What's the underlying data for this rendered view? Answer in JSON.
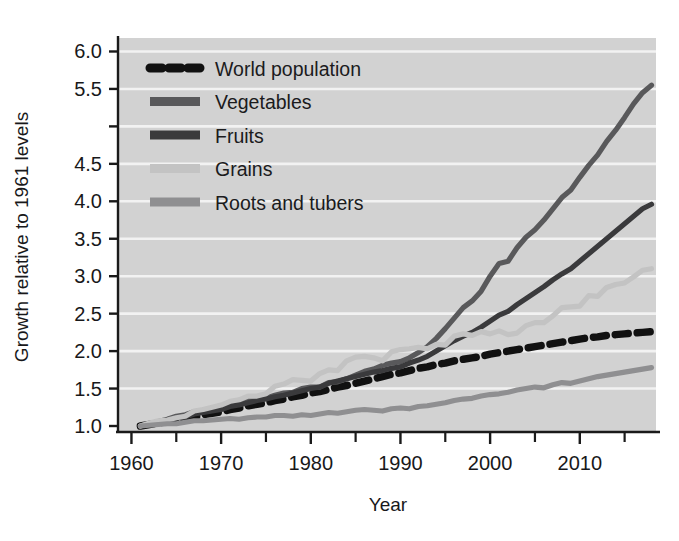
{
  "figure": {
    "background": "#ffffff",
    "plot_background": "#d2d2d2",
    "gridline_color": "#f2f2f2",
    "axis_color": "#1a1a1a"
  },
  "axes": {
    "x_title": "Year",
    "y_title": "Growth relative to 1961 levels",
    "x_ticks": [
      "1960",
      "1970",
      "1980",
      "1990",
      "2000",
      "2010"
    ],
    "x_tick_values": [
      1960,
      1970,
      1980,
      1990,
      2000,
      2010
    ],
    "x_minor_tick_values": [
      1965,
      1975,
      1985,
      1995,
      2005,
      2015
    ],
    "y_ticks": [
      "1.0",
      "1.5",
      "2.0",
      "2.5",
      "3.0",
      "3.5",
      "4.0",
      "4.5",
      "5.5",
      "6.0"
    ],
    "y_tick_values": [
      1.0,
      1.5,
      2.0,
      2.5,
      3.0,
      3.5,
      4.0,
      4.5,
      5.5,
      6.0
    ],
    "y_gridline_values": [
      1.5,
      2.0,
      2.5,
      3.0,
      3.5,
      4.0,
      4.5,
      5.0,
      5.5,
      6.0
    ],
    "xlim": [
      1958.5,
      2018.5
    ],
    "ylim": [
      0.92,
      6.18
    ]
  },
  "legend": {
    "position": "top-left-inside",
    "items": [
      {
        "label": "World population",
        "color": "#111111",
        "style": "dashed",
        "swatch": "dashed-thick"
      },
      {
        "label": "Vegetables",
        "color": "#59595b",
        "style": "solid",
        "swatch": "bar"
      },
      {
        "label": "Fruits",
        "color": "#3a3a3c",
        "style": "solid",
        "swatch": "bar"
      },
      {
        "label": "Grains",
        "color": "#c3c3c3",
        "style": "solid",
        "swatch": "bar"
      },
      {
        "label": "Roots and tubers",
        "color": "#8f8f91",
        "style": "solid",
        "swatch": "bar"
      }
    ]
  },
  "chart_data": {
    "type": "line",
    "title": "",
    "xlabel": "Year",
    "ylabel": "Growth relative to 1961 levels",
    "xlim": [
      1958.5,
      2018.5
    ],
    "ylim": [
      0.92,
      6.18
    ],
    "grid": true,
    "legend_position": "upper left",
    "x": [
      1961,
      1962,
      1963,
      1964,
      1965,
      1966,
      1967,
      1968,
      1969,
      1970,
      1971,
      1972,
      1973,
      1974,
      1975,
      1976,
      1977,
      1978,
      1979,
      1980,
      1981,
      1982,
      1983,
      1984,
      1985,
      1986,
      1987,
      1988,
      1989,
      1990,
      1991,
      1992,
      1993,
      1994,
      1995,
      1996,
      1997,
      1998,
      1999,
      2000,
      2001,
      2002,
      2003,
      2004,
      2005,
      2006,
      2007,
      2008,
      2009,
      2010,
      2011,
      2012,
      2013,
      2014,
      2015,
      2016,
      2017,
      2018
    ],
    "series": [
      {
        "name": "World population",
        "color": "#111111",
        "style": "dashed",
        "values": [
          1.0,
          1.02,
          1.04,
          1.06,
          1.08,
          1.1,
          1.12,
          1.15,
          1.17,
          1.19,
          1.22,
          1.24,
          1.27,
          1.29,
          1.31,
          1.34,
          1.36,
          1.39,
          1.41,
          1.44,
          1.46,
          1.49,
          1.52,
          1.54,
          1.57,
          1.6,
          1.63,
          1.66,
          1.69,
          1.71,
          1.74,
          1.77,
          1.79,
          1.82,
          1.84,
          1.87,
          1.89,
          1.91,
          1.93,
          1.96,
          1.98,
          2.0,
          2.02,
          2.04,
          2.06,
          2.08,
          2.1,
          2.12,
          2.14,
          2.16,
          2.18,
          2.19,
          2.21,
          2.22,
          2.23,
          2.24,
          2.25,
          2.26
        ]
      },
      {
        "name": "Vegetables",
        "color": "#59595b",
        "style": "solid",
        "values": [
          1.0,
          1.03,
          1.06,
          1.09,
          1.13,
          1.15,
          1.19,
          1.21,
          1.24,
          1.26,
          1.29,
          1.3,
          1.34,
          1.37,
          1.37,
          1.41,
          1.44,
          1.45,
          1.5,
          1.52,
          1.52,
          1.58,
          1.59,
          1.63,
          1.68,
          1.73,
          1.76,
          1.81,
          1.84,
          1.86,
          1.91,
          1.98,
          2.06,
          2.17,
          2.3,
          2.44,
          2.58,
          2.67,
          2.8,
          3.0,
          3.17,
          3.2,
          3.38,
          3.52,
          3.62,
          3.75,
          3.9,
          4.05,
          4.15,
          4.32,
          4.48,
          4.62,
          4.8,
          4.95,
          5.12,
          5.3,
          5.45,
          5.55
        ]
      },
      {
        "name": "Fruits",
        "color": "#3a3a3c",
        "style": "solid",
        "values": [
          1.0,
          1.03,
          1.05,
          1.08,
          1.1,
          1.12,
          1.16,
          1.18,
          1.2,
          1.22,
          1.26,
          1.28,
          1.31,
          1.34,
          1.36,
          1.39,
          1.41,
          1.44,
          1.47,
          1.5,
          1.52,
          1.57,
          1.6,
          1.63,
          1.66,
          1.69,
          1.72,
          1.74,
          1.77,
          1.79,
          1.84,
          1.88,
          1.93,
          2.0,
          2.07,
          2.14,
          2.2,
          2.25,
          2.32,
          2.4,
          2.48,
          2.53,
          2.62,
          2.7,
          2.78,
          2.86,
          2.95,
          3.03,
          3.1,
          3.2,
          3.3,
          3.4,
          3.5,
          3.6,
          3.7,
          3.8,
          3.9,
          3.96
        ]
      },
      {
        "name": "Grains",
        "color": "#c3c3c3",
        "style": "solid",
        "values": [
          1.0,
          1.04,
          1.07,
          1.08,
          1.11,
          1.13,
          1.2,
          1.22,
          1.25,
          1.28,
          1.33,
          1.35,
          1.4,
          1.4,
          1.43,
          1.53,
          1.56,
          1.62,
          1.61,
          1.6,
          1.7,
          1.75,
          1.74,
          1.87,
          1.92,
          1.93,
          1.91,
          1.87,
          1.99,
          2.02,
          2.03,
          2.05,
          2.03,
          2.09,
          2.08,
          2.2,
          2.23,
          2.21,
          2.26,
          2.23,
          2.27,
          2.22,
          2.24,
          2.34,
          2.38,
          2.38,
          2.47,
          2.58,
          2.59,
          2.6,
          2.74,
          2.73,
          2.85,
          2.89,
          2.91,
          2.99,
          3.08,
          3.1
        ]
      },
      {
        "name": "Roots and tubers",
        "color": "#8f8f91",
        "style": "solid",
        "values": [
          1.0,
          1.01,
          1.02,
          1.03,
          1.03,
          1.05,
          1.07,
          1.07,
          1.08,
          1.09,
          1.1,
          1.09,
          1.11,
          1.12,
          1.12,
          1.14,
          1.14,
          1.13,
          1.15,
          1.14,
          1.16,
          1.18,
          1.17,
          1.19,
          1.21,
          1.22,
          1.21,
          1.2,
          1.23,
          1.24,
          1.23,
          1.26,
          1.27,
          1.29,
          1.31,
          1.34,
          1.36,
          1.37,
          1.4,
          1.42,
          1.43,
          1.45,
          1.48,
          1.5,
          1.52,
          1.51,
          1.55,
          1.58,
          1.57,
          1.6,
          1.63,
          1.66,
          1.68,
          1.7,
          1.72,
          1.74,
          1.76,
          1.78
        ]
      }
    ]
  }
}
